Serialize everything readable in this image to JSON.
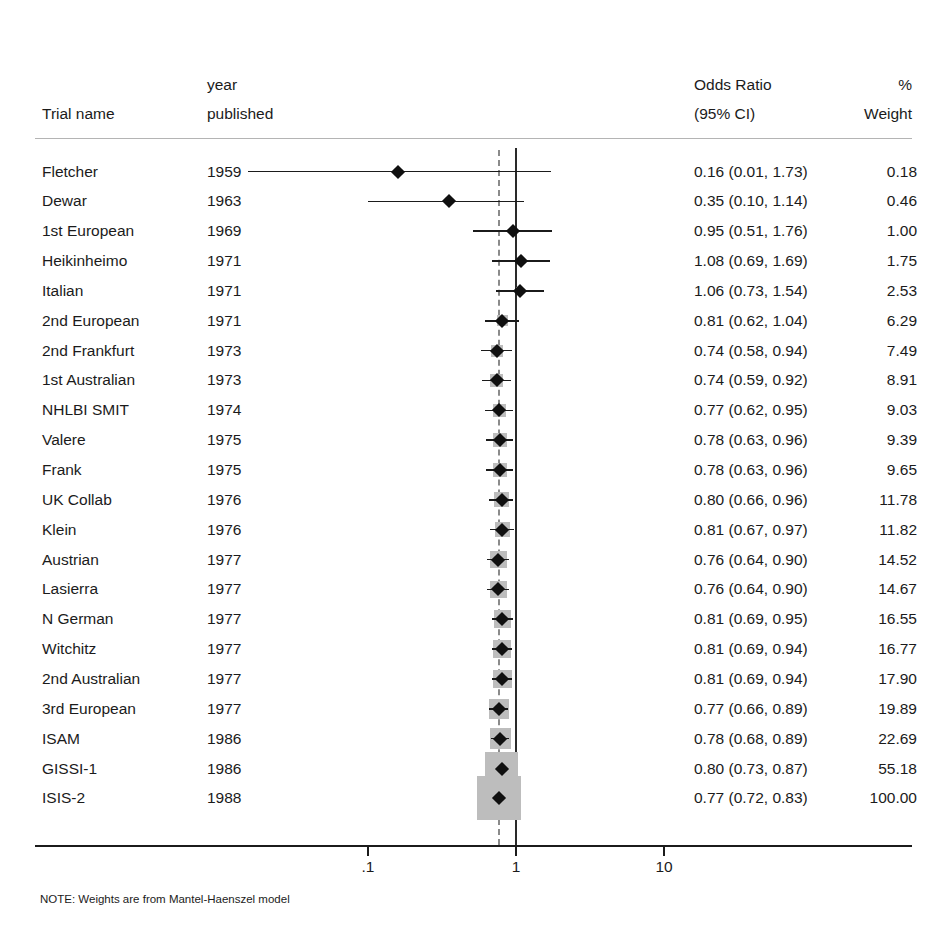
{
  "header": {
    "trial_name": "Trial name",
    "year_line1": "year",
    "year_line2": "published",
    "or_line1": "Odds Ratio",
    "or_line2": "(95% CI)",
    "weight_line1": "%",
    "weight_line2": "Weight"
  },
  "note": "NOTE: Weights are from Mantel-Haenszel model",
  "axis": {
    "ticks": [
      {
        "label": ".1",
        "value": 0.1
      },
      {
        "label": "1",
        "value": 1
      },
      {
        "label": "10",
        "value": 10
      }
    ],
    "scale": "log",
    "xmin": 0.0455,
    "xmax": 22.0
  },
  "reference_line": 1,
  "pooled_line": 0.77,
  "chart_data": {
    "type": "forest",
    "title": "",
    "xlabel": "",
    "ylabel": "",
    "effect_measure": "Odds Ratio",
    "ci_level": "95% CI",
    "weight_model": "Mantel-Haenszel",
    "columns": [
      "Trial name",
      "year published",
      "Odds Ratio (95% CI)",
      "% Weight"
    ],
    "reference_line": 1,
    "pooled_estimate": 0.77,
    "pooled_ci": [
      0.72,
      0.83
    ],
    "pooled_weight": 100.0,
    "axis_scale": "log",
    "rows": [
      {
        "name": "Fletcher",
        "year": "1959",
        "or": 0.16,
        "lo": 0.01,
        "hi": 1.73,
        "weight": 0.18,
        "est_text": "0.16 (0.01, 1.73)",
        "weight_text": "0.18"
      },
      {
        "name": "Dewar",
        "year": "1963",
        "or": 0.35,
        "lo": 0.1,
        "hi": 1.14,
        "weight": 0.46,
        "est_text": "0.35 (0.10, 1.14)",
        "weight_text": "0.46"
      },
      {
        "name": "1st European",
        "year": "1969",
        "or": 0.95,
        "lo": 0.51,
        "hi": 1.76,
        "weight": 1.0,
        "est_text": "0.95 (0.51, 1.76)",
        "weight_text": "1.00"
      },
      {
        "name": "Heikinheimo",
        "year": "1971",
        "or": 1.08,
        "lo": 0.69,
        "hi": 1.69,
        "weight": 1.75,
        "est_text": "1.08 (0.69, 1.69)",
        "weight_text": "1.75"
      },
      {
        "name": "Italian",
        "year": "1971",
        "or": 1.06,
        "lo": 0.73,
        "hi": 1.54,
        "weight": 2.53,
        "est_text": "1.06 (0.73, 1.54)",
        "weight_text": "2.53"
      },
      {
        "name": "2nd European",
        "year": "1971",
        "or": 0.81,
        "lo": 0.62,
        "hi": 1.04,
        "weight": 6.29,
        "est_text": "0.81 (0.62, 1.04)",
        "weight_text": "6.29"
      },
      {
        "name": "2nd Frankfurt",
        "year": "1973",
        "or": 0.74,
        "lo": 0.58,
        "hi": 0.94,
        "weight": 7.49,
        "est_text": "0.74 (0.58, 0.94)",
        "weight_text": "7.49"
      },
      {
        "name": "1st Australian",
        "year": "1973",
        "or": 0.74,
        "lo": 0.59,
        "hi": 0.92,
        "weight": 8.91,
        "est_text": "0.74 (0.59, 0.92)",
        "weight_text": "8.91"
      },
      {
        "name": "NHLBI SMIT",
        "year": "1974",
        "or": 0.77,
        "lo": 0.62,
        "hi": 0.95,
        "weight": 9.03,
        "est_text": "0.77 (0.62, 0.95)",
        "weight_text": "9.03"
      },
      {
        "name": "Valere",
        "year": "1975",
        "or": 0.78,
        "lo": 0.63,
        "hi": 0.96,
        "weight": 9.39,
        "est_text": "0.78 (0.63, 0.96)",
        "weight_text": "9.39"
      },
      {
        "name": "Frank",
        "year": "1975",
        "or": 0.78,
        "lo": 0.63,
        "hi": 0.96,
        "weight": 9.65,
        "est_text": "0.78 (0.63, 0.96)",
        "weight_text": "9.65"
      },
      {
        "name": "UK Collab",
        "year": "1976",
        "or": 0.8,
        "lo": 0.66,
        "hi": 0.96,
        "weight": 11.78,
        "est_text": "0.80 (0.66, 0.96)",
        "weight_text": "11.78"
      },
      {
        "name": "Klein",
        "year": "1976",
        "or": 0.81,
        "lo": 0.67,
        "hi": 0.97,
        "weight": 11.82,
        "est_text": "0.81 (0.67, 0.97)",
        "weight_text": "11.82"
      },
      {
        "name": "Austrian",
        "year": "1977",
        "or": 0.76,
        "lo": 0.64,
        "hi": 0.9,
        "weight": 14.52,
        "est_text": "0.76 (0.64, 0.90)",
        "weight_text": "14.52"
      },
      {
        "name": "Lasierra",
        "year": "1977",
        "or": 0.76,
        "lo": 0.64,
        "hi": 0.9,
        "weight": 14.67,
        "est_text": "0.76 (0.64, 0.90)",
        "weight_text": "14.67"
      },
      {
        "name": "N German",
        "year": "1977",
        "or": 0.81,
        "lo": 0.69,
        "hi": 0.95,
        "weight": 16.55,
        "est_text": "0.81 (0.69, 0.95)",
        "weight_text": "16.55"
      },
      {
        "name": "Witchitz",
        "year": "1977",
        "or": 0.81,
        "lo": 0.69,
        "hi": 0.94,
        "weight": 16.77,
        "est_text": "0.81 (0.69, 0.94)",
        "weight_text": "16.77"
      },
      {
        "name": "2nd Australian",
        "year": "1977",
        "or": 0.81,
        "lo": 0.69,
        "hi": 0.94,
        "weight": 17.9,
        "est_text": "0.81 (0.69, 0.94)",
        "weight_text": "17.90"
      },
      {
        "name": "3rd European",
        "year": "1977",
        "or": 0.77,
        "lo": 0.66,
        "hi": 0.89,
        "weight": 19.89,
        "est_text": "0.77 (0.66, 0.89)",
        "weight_text": "19.89"
      },
      {
        "name": "ISAM",
        "year": "1986",
        "or": 0.78,
        "lo": 0.68,
        "hi": 0.89,
        "weight": 22.69,
        "est_text": "0.78 (0.68, 0.89)",
        "weight_text": "22.69"
      },
      {
        "name": "GISSI-1",
        "year": "1986",
        "or": 0.8,
        "lo": 0.73,
        "hi": 0.87,
        "weight": 55.18,
        "est_text": "0.80 (0.73, 0.87)",
        "weight_text": "55.18"
      },
      {
        "name": "ISIS-2",
        "year": "1988",
        "or": 0.77,
        "lo": 0.72,
        "hi": 0.83,
        "weight": 100.0,
        "est_text": "0.77 (0.72, 0.83)",
        "weight_text": "100.00"
      }
    ]
  }
}
